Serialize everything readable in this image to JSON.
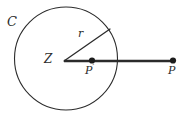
{
  "figure": {
    "type": "geometry-diagram",
    "background_color": "#ffffff",
    "stroke_color": "#2b2b2b",
    "labels": {
      "circle": "C",
      "center": "Z",
      "radius": "r",
      "inverse_point": "P",
      "inverse_point_prime_mark": "′",
      "exterior_point": "P"
    },
    "geometry": {
      "circle": {
        "cx": 66,
        "cy": 58.5,
        "r": 51.5,
        "stroke_width": 1.1
      },
      "center_point": {
        "x": 64,
        "y": 61
      },
      "radius_line": {
        "x1": 64,
        "y1": 61,
        "x2": 110,
        "y2": 29,
        "stroke_width": 1.3
      },
      "ray_line": {
        "x1": 64,
        "y1": 61,
        "x2": 173,
        "y2": 61,
        "stroke_width": 2.4
      },
      "point_p_prime": {
        "x": 92,
        "y": 60.5,
        "r": 3.1
      },
      "point_p": {
        "x": 173,
        "y": 60.5,
        "r": 3.1
      }
    }
  }
}
